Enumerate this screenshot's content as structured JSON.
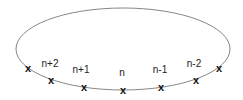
{
  "diagram": {
    "ellipse": {
      "cx": 123,
      "cy": 49,
      "rx": 107,
      "ry": 41,
      "stroke": "#888888"
    },
    "markers": [
      {
        "symbol": "x",
        "x": 28,
        "y": 68,
        "label": ""
      },
      {
        "symbol": "x",
        "x": 51,
        "y": 80,
        "label": "n+2",
        "label_x": 50,
        "label_y": 67
      },
      {
        "symbol": "x",
        "x": 84,
        "y": 87,
        "label": "n+1",
        "label_x": 81,
        "label_y": 73
      },
      {
        "symbol": "x",
        "x": 123,
        "y": 90,
        "label": "n",
        "label_x": 122,
        "label_y": 76
      },
      {
        "symbol": "x",
        "x": 161,
        "y": 87,
        "label": "n-1",
        "label_x": 160,
        "label_y": 73
      },
      {
        "symbol": "x",
        "x": 196,
        "y": 80,
        "label": "n-2",
        "label_x": 194,
        "label_y": 67
      },
      {
        "symbol": "x",
        "x": 219,
        "y": 68,
        "label": ""
      }
    ]
  }
}
